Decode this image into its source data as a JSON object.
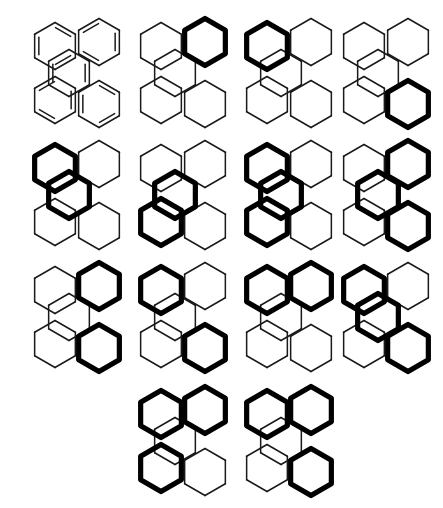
{
  "figure": {
    "background_color": "#ffffff",
    "line_color": "#1a1a1a",
    "bold_color": "#000000",
    "rows": 4,
    "columns": 4,
    "structure_count": 14
  },
  "skeleton": {
    "description": "Five fused hexagons: upper-left, upper-right, center, lower-left, lower-right",
    "ring_ids": [
      "UL",
      "UR",
      "C",
      "LL",
      "LR"
    ],
    "ring_centers": {
      "UL": [
        33,
        34
      ],
      "UR": [
        77,
        30
      ],
      "C": [
        47,
        61
      ],
      "LL": [
        33,
        88
      ],
      "LR": [
        77,
        92
      ]
    },
    "hex_radius": 23.5
  },
  "structures": [
    {
      "index": 1,
      "label": "1",
      "type": "kekule",
      "bold_rings": [],
      "position": [
        22,
        12
      ],
      "double_bond_rings": [
        "UL",
        "UR",
        "LL",
        "LR",
        "C"
      ]
    },
    {
      "index": 2,
      "label": "2",
      "type": "clar",
      "bold_rings": [
        "UR"
      ],
      "position": [
        128,
        12
      ]
    },
    {
      "index": 3,
      "label": "3",
      "type": "clar",
      "bold_rings": [
        "UL"
      ],
      "position": [
        234,
        12
      ]
    },
    {
      "index": 4,
      "label": "4",
      "type": "clar",
      "bold_rings": [
        "LR"
      ],
      "position": [
        331,
        12
      ]
    },
    {
      "index": 5,
      "label": "5",
      "type": "clar",
      "bold_rings": [
        "UL",
        "C"
      ],
      "position": [
        22,
        134
      ]
    },
    {
      "index": 6,
      "label": "6",
      "type": "clar",
      "bold_rings": [
        "C",
        "LL"
      ],
      "position": [
        128,
        134
      ]
    },
    {
      "index": 7,
      "label": "7",
      "type": "clar",
      "bold_rings": [
        "UL",
        "C",
        "LL"
      ],
      "position": [
        234,
        134
      ]
    },
    {
      "index": 8,
      "label": "8",
      "type": "clar",
      "bold_rings": [
        "UR",
        "C",
        "LR"
      ],
      "position": [
        331,
        134
      ]
    },
    {
      "index": 9,
      "label": "9",
      "type": "clar",
      "bold_rings": [
        "UR",
        "LR"
      ],
      "position": [
        22,
        256
      ]
    },
    {
      "index": 10,
      "label": "10",
      "type": "clar",
      "bold_rings": [
        "UL",
        "LR"
      ],
      "position": [
        128,
        256
      ]
    },
    {
      "index": 11,
      "label": "11",
      "type": "clar",
      "bold_rings": [
        "UL",
        "UR"
      ],
      "position": [
        234,
        256
      ]
    },
    {
      "index": 12,
      "label": "12",
      "type": "clar",
      "bold_rings": [
        "UL",
        "C",
        "LR"
      ],
      "position": [
        331,
        256
      ]
    },
    {
      "index": 13,
      "label": "13",
      "type": "clar",
      "bold_rings": [
        "UL",
        "UR",
        "LL"
      ],
      "position": [
        128,
        380
      ]
    },
    {
      "index": 14,
      "label": "14",
      "type": "clar",
      "bold_rings": [
        "UL",
        "UR",
        "LR"
      ],
      "position": [
        234,
        380
      ]
    }
  ]
}
